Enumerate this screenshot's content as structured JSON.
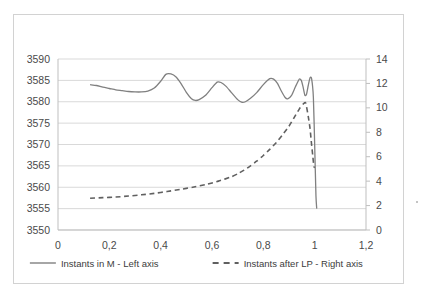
{
  "chart_data": {
    "type": "line",
    "title": "",
    "subtitle": "",
    "xlabel": "",
    "ylabel": "",
    "grid": true,
    "legend_position": "bottom",
    "decimal_separator": ",",
    "x": {
      "ticks": [
        0,
        0.2,
        0.4,
        0.6,
        0.8,
        1.0,
        1.2
      ],
      "tick_labels": [
        "0",
        "0,2",
        "0,4",
        "0,6",
        "0,8",
        "1",
        "1,2"
      ],
      "lim": [
        0,
        1.2
      ]
    },
    "y_left": {
      "ticks": [
        3550,
        3555,
        3560,
        3565,
        3570,
        3575,
        3580,
        3585,
        3590
      ],
      "tick_labels": [
        "3550",
        "3555",
        "3560",
        "3565",
        "3570",
        "3575",
        "3580",
        "3585",
        "3590"
      ],
      "lim": [
        3550,
        3590
      ]
    },
    "y_right": {
      "ticks": [
        0,
        2,
        4,
        6,
        8,
        10,
        12,
        14
      ],
      "tick_labels": [
        "0",
        "2",
        "4",
        "6",
        "8",
        "10",
        "12",
        "14"
      ],
      "lim": [
        0,
        14
      ]
    },
    "series": [
      {
        "name": "Instants in M - Left axis",
        "axis": "left",
        "style": "solid",
        "color": "#808080",
        "points": [
          [
            0.125,
            3584.0
          ],
          [
            0.15,
            3583.8
          ],
          [
            0.175,
            3583.4
          ],
          [
            0.2,
            3583.1
          ],
          [
            0.225,
            3582.8
          ],
          [
            0.25,
            3582.6
          ],
          [
            0.275,
            3582.4
          ],
          [
            0.3,
            3582.3
          ],
          [
            0.325,
            3582.3
          ],
          [
            0.35,
            3582.5
          ],
          [
            0.375,
            3583.2
          ],
          [
            0.4,
            3584.8
          ],
          [
            0.42,
            3586.4
          ],
          [
            0.44,
            3586.5
          ],
          [
            0.46,
            3585.8
          ],
          [
            0.48,
            3584.2
          ],
          [
            0.5,
            3582.2
          ],
          [
            0.52,
            3580.7
          ],
          [
            0.535,
            3580.3
          ],
          [
            0.55,
            3580.5
          ],
          [
            0.575,
            3581.5
          ],
          [
            0.6,
            3583.3
          ],
          [
            0.62,
            3584.6
          ],
          [
            0.635,
            3584.5
          ],
          [
            0.655,
            3583.6
          ],
          [
            0.675,
            3582.2
          ],
          [
            0.7,
            3580.5
          ],
          [
            0.715,
            3579.9
          ],
          [
            0.73,
            3580.0
          ],
          [
            0.75,
            3580.8
          ],
          [
            0.775,
            3582.2
          ],
          [
            0.8,
            3584.0
          ],
          [
            0.825,
            3585.4
          ],
          [
            0.84,
            3585.3
          ],
          [
            0.855,
            3584.3
          ],
          [
            0.87,
            3582.5
          ],
          [
            0.885,
            3581.0
          ],
          [
            0.895,
            3580.7
          ],
          [
            0.91,
            3581.5
          ],
          [
            0.925,
            3583.5
          ],
          [
            0.94,
            3585.3
          ],
          [
            0.948,
            3585.0
          ],
          [
            0.955,
            3583.4
          ],
          [
            0.962,
            3581.5
          ],
          [
            0.968,
            3581.7
          ],
          [
            0.975,
            3583.8
          ],
          [
            0.982,
            3585.6
          ],
          [
            0.988,
            3585.4
          ],
          [
            0.995,
            3581.0
          ],
          [
            1.0,
            3570.0
          ],
          [
            1.005,
            3558.0
          ],
          [
            1.008,
            3555.0
          ]
        ]
      },
      {
        "name": "Instants after LP - Right axis",
        "axis": "right",
        "style": "dashed",
        "color": "#606060",
        "points": [
          [
            0.125,
            2.6
          ],
          [
            0.175,
            2.65
          ],
          [
            0.225,
            2.7
          ],
          [
            0.275,
            2.78
          ],
          [
            0.325,
            2.88
          ],
          [
            0.375,
            3.0
          ],
          [
            0.425,
            3.15
          ],
          [
            0.475,
            3.32
          ],
          [
            0.525,
            3.5
          ],
          [
            0.575,
            3.72
          ],
          [
            0.625,
            4.0
          ],
          [
            0.675,
            4.35
          ],
          [
            0.7,
            4.6
          ],
          [
            0.725,
            4.9
          ],
          [
            0.75,
            5.25
          ],
          [
            0.775,
            5.65
          ],
          [
            0.8,
            6.1
          ],
          [
            0.825,
            6.6
          ],
          [
            0.85,
            7.15
          ],
          [
            0.875,
            7.8
          ],
          [
            0.9,
            8.5
          ],
          [
            0.92,
            9.2
          ],
          [
            0.94,
            9.9
          ],
          [
            0.955,
            10.3
          ],
          [
            0.965,
            10.4
          ],
          [
            0.975,
            9.3
          ],
          [
            0.982,
            8.3
          ],
          [
            0.988,
            7.0
          ],
          [
            0.993,
            6.0
          ],
          [
            0.997,
            5.2
          ],
          [
            1.0,
            5.1
          ]
        ]
      }
    ],
    "legend": [
      {
        "label": "Instants in M - Left axis",
        "style": "solid",
        "color": "#808080"
      },
      {
        "label": "Instants after LP - Right axis",
        "style": "dashed",
        "color": "#606060"
      }
    ]
  }
}
